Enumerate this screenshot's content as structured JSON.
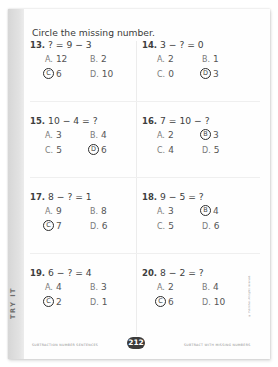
{
  "strip_label": "TRY IT",
  "instructions": "Circle the missing number.",
  "problems": [
    {
      "number": "13.",
      "question": "? = 9 − 3",
      "choices": [
        {
          "letter": "A.",
          "value": "12"
        },
        {
          "letter": "B.",
          "value": "2"
        },
        {
          "letter": "C",
          "value": "6",
          "circled": true
        },
        {
          "letter": "D.",
          "value": "10"
        }
      ]
    },
    {
      "number": "14.",
      "question": "3 − ? = 0",
      "choices": [
        {
          "letter": "A.",
          "value": "2"
        },
        {
          "letter": "B.",
          "value": "1"
        },
        {
          "letter": "C.",
          "value": "0"
        },
        {
          "letter": "D",
          "value": "3",
          "circled": true
        }
      ]
    },
    {
      "number": "15.",
      "question": "10 − 4 = ?",
      "choices": [
        {
          "letter": "A.",
          "value": "3"
        },
        {
          "letter": "B.",
          "value": "4"
        },
        {
          "letter": "C.",
          "value": "5"
        },
        {
          "letter": "D",
          "value": "6",
          "circled": true
        }
      ]
    },
    {
      "number": "16.",
      "question": "7 = 10 − ?",
      "choices": [
        {
          "letter": "A.",
          "value": "2"
        },
        {
          "letter": "B",
          "value": "3",
          "circled": true
        },
        {
          "letter": "C.",
          "value": "4"
        },
        {
          "letter": "D.",
          "value": "5"
        }
      ]
    },
    {
      "number": "17.",
      "question": "8 − ? = 1",
      "choices": [
        {
          "letter": "A.",
          "value": "9"
        },
        {
          "letter": "B.",
          "value": "8"
        },
        {
          "letter": "C",
          "value": "7",
          "circled": true
        },
        {
          "letter": "D.",
          "value": "6"
        }
      ]
    },
    {
      "number": "18.",
      "question": "9 − 5 = ?",
      "choices": [
        {
          "letter": "A.",
          "value": "3"
        },
        {
          "letter": "B",
          "value": "4",
          "circled": true
        },
        {
          "letter": "C.",
          "value": "5"
        },
        {
          "letter": "D.",
          "value": "6"
        }
      ]
    },
    {
      "number": "19.",
      "question": "6 − ? = 4",
      "choices": [
        {
          "letter": "A.",
          "value": "4"
        },
        {
          "letter": "B.",
          "value": "3"
        },
        {
          "letter": "C",
          "value": "2",
          "circled": true
        },
        {
          "letter": "D.",
          "value": "1"
        }
      ]
    },
    {
      "number": "20.",
      "question": "8 − 2 = ?",
      "choices": [
        {
          "letter": "A.",
          "value": "2"
        },
        {
          "letter": "B.",
          "value": "4"
        },
        {
          "letter": "C",
          "value": "6",
          "circled": true
        },
        {
          "letter": "D.",
          "value": "10"
        }
      ]
    }
  ],
  "footer": {
    "left": "SUBTRACTION NUMBER SENTENCES",
    "page_number": "212",
    "right": "SUBTRACT WITH MISSING NUMBERS"
  },
  "copyright": "© Publisher. All rights reserved."
}
